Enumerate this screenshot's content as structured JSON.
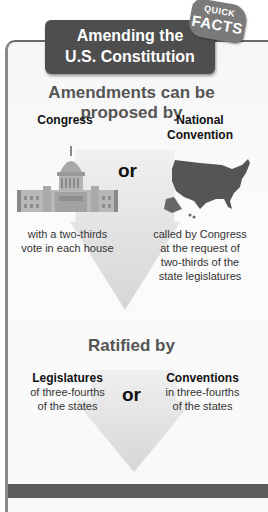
{
  "badge": {
    "line1": "QUICK",
    "line2": "FACTS"
  },
  "title": {
    "line1": "Amending the",
    "line2": "U.S. Constitution"
  },
  "proposal": {
    "heading": "Amendments can be proposed by",
    "left": {
      "label": "Congress",
      "icon": "capitol-building-icon",
      "description": [
        "with a two-thirds",
        "vote in each house"
      ]
    },
    "connector": "or",
    "right": {
      "label": [
        "National",
        "Convention"
      ],
      "icon": "us-map-icon",
      "description": [
        "called by Congress",
        "at the request of",
        "two-thirds of the",
        "state legislatures"
      ]
    }
  },
  "ratification": {
    "heading": "Ratified by",
    "left": {
      "label": "Legislatures",
      "description": [
        "of three-fourths",
        "of the states"
      ]
    },
    "connector": "or",
    "right": {
      "label": "Conventions",
      "description": [
        "in three-fourths",
        "of the states"
      ]
    }
  },
  "colors": {
    "title_bg": "#4e4e4e",
    "badge_bg": "#7a7a7a",
    "frame_border": "#8a8a8a",
    "heading_text": "#555555",
    "arrow": "#dcdcdc",
    "map_fill": "#555555",
    "footer_bar": "#5c5c5c"
  }
}
